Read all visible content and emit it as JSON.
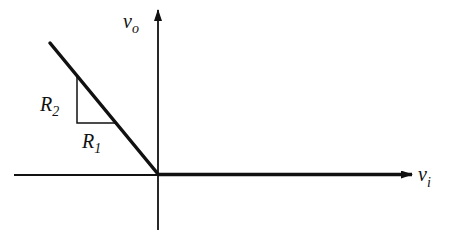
{
  "figure": {
    "type": "transfer-characteristic",
    "axes": {
      "x_label": {
        "main": "v",
        "sub": "i"
      },
      "y_label": {
        "main": "v",
        "sub": "o"
      }
    },
    "slope_triangle": {
      "vertical_label": {
        "main": "R",
        "sub": "2"
      },
      "horizontal_label": {
        "main": "R",
        "sub": "1"
      }
    },
    "colors": {
      "line": "#111111",
      "background": "#ffffff"
    }
  }
}
